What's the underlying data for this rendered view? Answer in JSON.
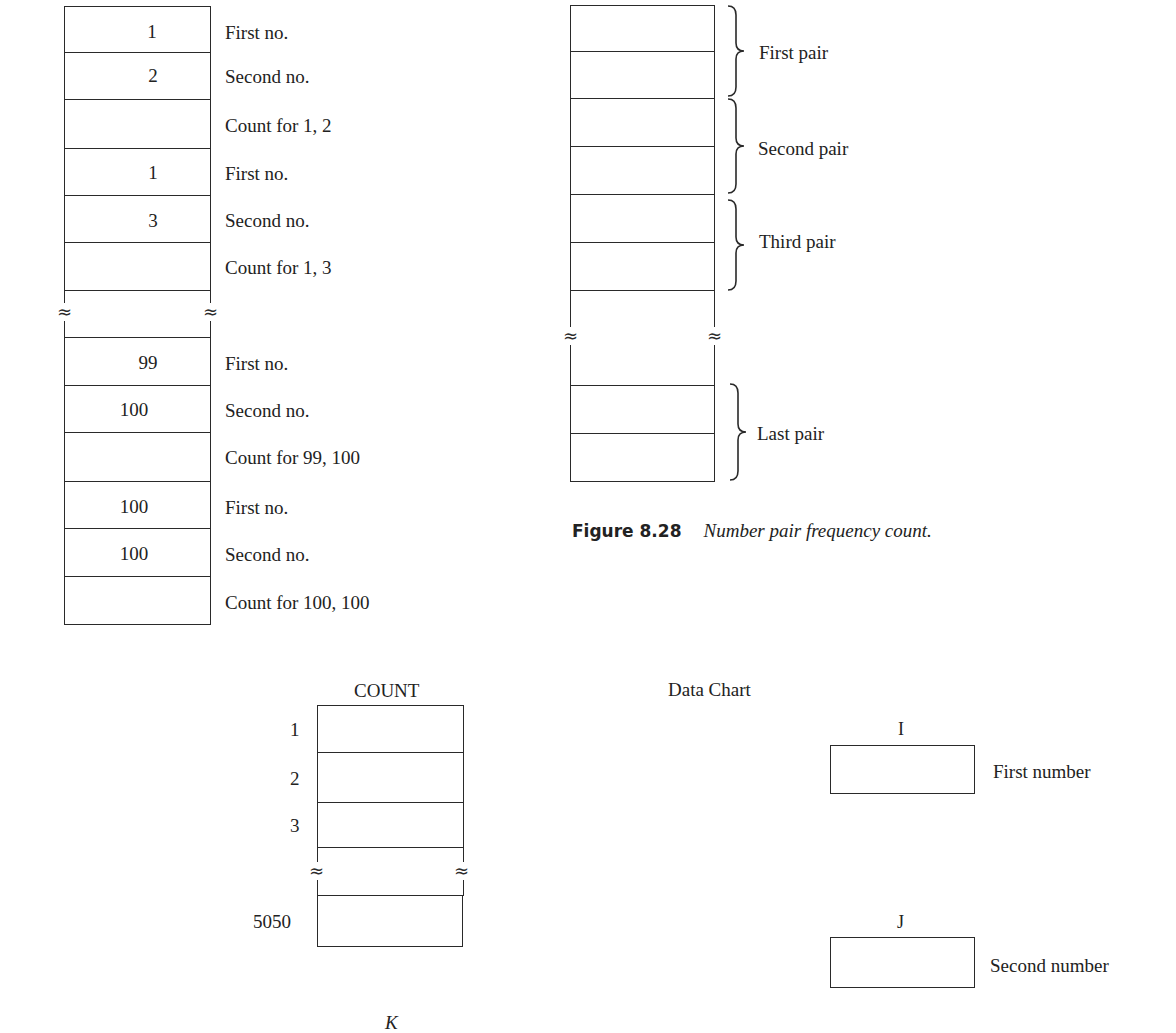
{
  "left_diagram": {
    "rows": [
      {
        "value": "1",
        "label": "First no."
      },
      {
        "value": "2",
        "label": "Second no."
      },
      {
        "value": "",
        "label": "Count for 1, 2"
      },
      {
        "value": "1",
        "label": "First no."
      },
      {
        "value": "3",
        "label": "Second no."
      },
      {
        "value": "",
        "label": "Count for 1, 3"
      },
      {
        "value": "",
        "label": ""
      },
      {
        "value": "99",
        "label": "First no."
      },
      {
        "value": "100",
        "label": "Second no."
      },
      {
        "value": "",
        "label": "Count for 99, 100"
      },
      {
        "value": "100",
        "label": "First no."
      },
      {
        "value": "100",
        "label": "Second no."
      },
      {
        "value": "",
        "label": "Count for 100, 100"
      }
    ],
    "break_symbol": "≈"
  },
  "pair_diagram": {
    "groups": [
      {
        "label": "First pair"
      },
      {
        "label": "Second pair"
      },
      {
        "label": "Third pair"
      },
      {
        "label": "Last pair"
      }
    ],
    "break_symbol": "≈"
  },
  "figure_caption": {
    "number": "Figure 8.28",
    "text": "Number pair frequency count."
  },
  "count_diagram": {
    "title": "COUNT",
    "indices": [
      "1",
      "2",
      "3",
      "5050"
    ],
    "index_variable": "K",
    "break_symbol": "≈"
  },
  "data_chart": {
    "title": "Data Chart",
    "variables": [
      {
        "name": "I",
        "label": "First number"
      },
      {
        "name": "J",
        "label": "Second number"
      }
    ]
  }
}
